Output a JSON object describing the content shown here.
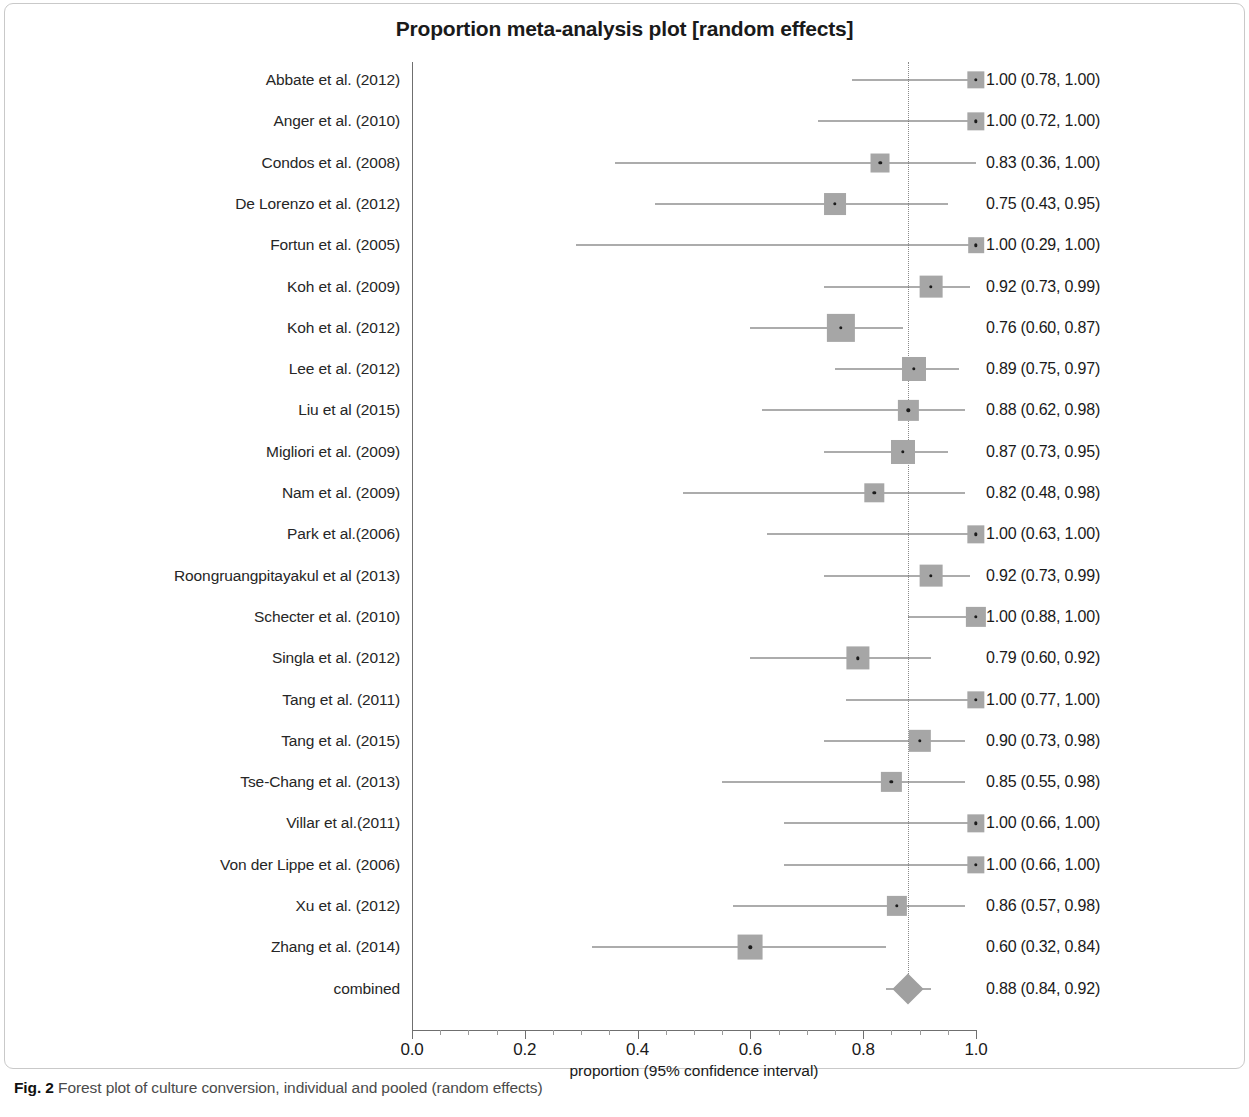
{
  "figure": {
    "title": "Proportion meta-analysis plot [random effects]",
    "caption_label": "Fig. 2",
    "caption_text": "Forest plot of culture conversion, individual and pooled (random effects)"
  },
  "axis": {
    "title": "proportion (95% confidence interval)",
    "ticks": [
      "0.0",
      "0.2",
      "0.4",
      "0.6",
      "0.8",
      "1.0"
    ],
    "tick_values": [
      0.0,
      0.2,
      0.4,
      0.6,
      0.8,
      1.0
    ]
  },
  "chart_data": {
    "type": "forest",
    "title": "Proportion meta-analysis plot [random effects]",
    "xlabel": "proportion (95% confidence interval)",
    "ylabel": "",
    "xlim": [
      0.0,
      1.0
    ],
    "grid": false,
    "legend": "none",
    "reference_line": 0.88,
    "effect_measure": "proportion",
    "model": "random effects",
    "studies": [
      {
        "label": "Abbate et al. (2012)",
        "estimate": 1.0,
        "lower": 0.78,
        "upper": 1.0,
        "text": "1.00 (0.78, 1.00)",
        "weight": 0.3
      },
      {
        "label": "Anger et al. (2010)",
        "estimate": 1.0,
        "lower": 0.72,
        "upper": 1.0,
        "text": "1.00 (0.72, 1.00)",
        "weight": 0.3
      },
      {
        "label": "Condos et al. (2008)",
        "estimate": 0.83,
        "lower": 0.36,
        "upper": 1.0,
        "text": "0.83 (0.36, 1.00)",
        "weight": 0.38
      },
      {
        "label": "De Lorenzo et al. (2012)",
        "estimate": 0.75,
        "lower": 0.43,
        "upper": 0.95,
        "text": "0.75 (0.43, 0.95)",
        "weight": 0.52
      },
      {
        "label": "Fortun et al. (2005)",
        "estimate": 1.0,
        "lower": 0.29,
        "upper": 1.0,
        "text": "1.00 (0.29, 1.00)",
        "weight": 0.22
      },
      {
        "label": "Koh et al. (2009)",
        "estimate": 0.92,
        "lower": 0.73,
        "upper": 0.99,
        "text": "0.92 (0.73, 0.99)",
        "weight": 0.56
      },
      {
        "label": "Koh et al. (2012)",
        "estimate": 0.76,
        "lower": 0.6,
        "upper": 0.87,
        "text": "0.76 (0.60, 0.87)",
        "weight": 0.82
      },
      {
        "label": "Lee et al. (2012)",
        "estimate": 0.89,
        "lower": 0.75,
        "upper": 0.97,
        "text": "0.89 (0.75, 0.97)",
        "weight": 0.62
      },
      {
        "label": "Liu et al (2015)",
        "estimate": 0.88,
        "lower": 0.62,
        "upper": 0.98,
        "text": "0.88 (0.62, 0.98)",
        "weight": 0.44
      },
      {
        "label": "Migliori et al. (2009)",
        "estimate": 0.87,
        "lower": 0.73,
        "upper": 0.95,
        "text": "0.87 (0.73, 0.95)",
        "weight": 0.62
      },
      {
        "label": "Nam et al. (2009)",
        "estimate": 0.82,
        "lower": 0.48,
        "upper": 0.98,
        "text": "0.82 (0.48, 0.98)",
        "weight": 0.4
      },
      {
        "label": "Park et al.(2006)",
        "estimate": 1.0,
        "lower": 0.63,
        "upper": 1.0,
        "text": "1.00 (0.63, 1.00)",
        "weight": 0.3
      },
      {
        "label": "Roongruangpitayakul et al (2013)",
        "estimate": 0.92,
        "lower": 0.73,
        "upper": 0.99,
        "text": "0.92 (0.73, 0.99)",
        "weight": 0.56
      },
      {
        "label": "Schecter et al. (2010)",
        "estimate": 1.0,
        "lower": 0.88,
        "upper": 1.0,
        "text": "1.00 (0.88, 1.00)",
        "weight": 0.44
      },
      {
        "label": "Singla et al. (2012)",
        "estimate": 0.79,
        "lower": 0.6,
        "upper": 0.92,
        "text": "0.79 (0.60, 0.92)",
        "weight": 0.58
      },
      {
        "label": "Tang et al. (2011)",
        "estimate": 1.0,
        "lower": 0.77,
        "upper": 1.0,
        "text": "1.00 (0.77, 1.00)",
        "weight": 0.3
      },
      {
        "label": "Tang et al. (2015)",
        "estimate": 0.9,
        "lower": 0.73,
        "upper": 0.98,
        "text": "0.90 (0.73, 0.98)",
        "weight": 0.54
      },
      {
        "label": "Tse-Chang et al. (2013)",
        "estimate": 0.85,
        "lower": 0.55,
        "upper": 0.98,
        "text": "0.85 (0.55, 0.98)",
        "weight": 0.44
      },
      {
        "label": "Villar et al.(2011)",
        "estimate": 1.0,
        "lower": 0.66,
        "upper": 1.0,
        "text": "1.00 (0.66, 1.00)",
        "weight": 0.3
      },
      {
        "label": "Von der Lippe et al. (2006)",
        "estimate": 1.0,
        "lower": 0.66,
        "upper": 1.0,
        "text": "1.00 (0.66, 1.00)",
        "weight": 0.3
      },
      {
        "label": "Xu et al. (2012)",
        "estimate": 0.86,
        "lower": 0.57,
        "upper": 0.98,
        "text": "0.86 (0.57, 0.98)",
        "weight": 0.44
      },
      {
        "label": "Zhang et al. (2014)",
        "estimate": 0.6,
        "lower": 0.32,
        "upper": 0.84,
        "text": "0.60 (0.32, 0.84)",
        "weight": 0.66
      }
    ],
    "combined": {
      "label": "combined",
      "estimate": 0.88,
      "lower": 0.84,
      "upper": 0.92,
      "text": "0.88 (0.84, 0.92)"
    }
  }
}
